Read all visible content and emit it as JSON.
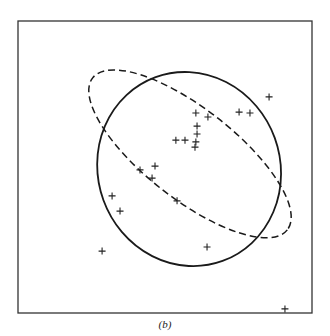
{
  "caption": "(b)",
  "chart_data": {
    "type": "scatter",
    "title": "",
    "xlabel": "",
    "ylabel": "",
    "xlim": [
      0,
      100
    ],
    "ylim": [
      0,
      100
    ],
    "grid": false,
    "legend": null,
    "marker": "+",
    "colors": {
      "axis": "#333333",
      "marker": "#222222",
      "ellipse": "#1a1a1a"
    },
    "points": [
      {
        "x": 85.4,
        "y": 74.0
      },
      {
        "x": 75.2,
        "y": 68.8
      },
      {
        "x": 78.9,
        "y": 68.5
      },
      {
        "x": 60.5,
        "y": 68.5
      },
      {
        "x": 64.6,
        "y": 67.1
      },
      {
        "x": 60.9,
        "y": 64.0
      },
      {
        "x": 60.9,
        "y": 61.3
      },
      {
        "x": 53.7,
        "y": 59.2
      },
      {
        "x": 56.8,
        "y": 59.2
      },
      {
        "x": 60.5,
        "y": 58.6
      },
      {
        "x": 60.2,
        "y": 56.8
      },
      {
        "x": 46.6,
        "y": 50.3
      },
      {
        "x": 41.5,
        "y": 49.0
      },
      {
        "x": 45.6,
        "y": 46.2
      },
      {
        "x": 32.0,
        "y": 40.1
      },
      {
        "x": 34.7,
        "y": 34.9
      },
      {
        "x": 54.1,
        "y": 38.4
      },
      {
        "x": 28.6,
        "y": 21.2
      },
      {
        "x": 64.3,
        "y": 22.6
      },
      {
        "x": 90.8,
        "y": 1.4
      }
    ],
    "ellipses": [
      {
        "name": "solid",
        "style": "solid",
        "cx": 58.2,
        "cy": 49.3,
        "rx": 31.0,
        "ry": 33.5,
        "angle_deg": -20
      },
      {
        "name": "dashed",
        "style": "dashed",
        "cx": 58.5,
        "cy": 54.5,
        "rx": 42.0,
        "ry": 15.5,
        "angle_deg": 38
      }
    ]
  }
}
